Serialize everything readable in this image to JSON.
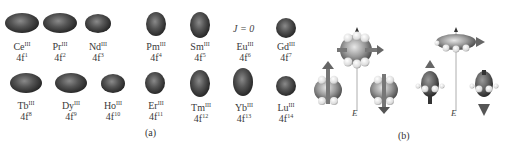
{
  "figure": {
    "panel_a_label": "(a)",
    "panel_b_label": "(b)",
    "j_zero_note": "J = 0",
    "field_label": "E",
    "ions_top": [
      {
        "element": "Ce",
        "ox": "III",
        "config": "4f",
        "n": "1",
        "shape": "oblate"
      },
      {
        "element": "Pr",
        "ox": "III",
        "config": "4f",
        "n": "2",
        "shape": "oblate"
      },
      {
        "element": "Nd",
        "ox": "III",
        "config": "4f",
        "n": "3",
        "shape": "oblate-small"
      },
      {
        "element": "Pm",
        "ox": "III",
        "config": "4f",
        "n": "4",
        "shape": "prolate"
      },
      {
        "element": "Sm",
        "ox": "III",
        "config": "4f",
        "n": "5",
        "shape": "prolate"
      },
      {
        "element": "Eu",
        "ox": "III",
        "config": "4f",
        "n": "6",
        "shape": "none"
      },
      {
        "element": "Gd",
        "ox": "III",
        "config": "4f",
        "n": "7",
        "shape": "sphere"
      }
    ],
    "ions_bottom": [
      {
        "element": "Tb",
        "ox": "III",
        "config": "4f",
        "n": "8",
        "shape": "oblate"
      },
      {
        "element": "Dy",
        "ox": "III",
        "config": "4f",
        "n": "9",
        "shape": "oblate"
      },
      {
        "element": "Ho",
        "ox": "III",
        "config": "4f",
        "n": "10",
        "shape": "oblate-small"
      },
      {
        "element": "Er",
        "ox": "III",
        "config": "4f",
        "n": "11",
        "shape": "prolate"
      },
      {
        "element": "Tm",
        "ox": "III",
        "config": "4f",
        "n": "12",
        "shape": "prolate"
      },
      {
        "element": "Yb",
        "ox": "III",
        "config": "4f",
        "n": "13",
        "shape": "prolate"
      },
      {
        "element": "Lu",
        "ox": "III",
        "config": "4f",
        "n": "14",
        "shape": "sphere"
      }
    ]
  }
}
